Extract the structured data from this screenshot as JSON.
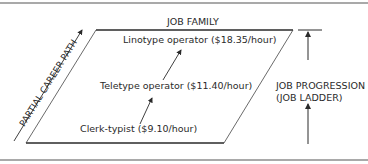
{
  "diagram": {
    "title": "JOB FAMILY",
    "jobs": [
      {
        "label": "Linotype operator ($18.35/hour)"
      },
      {
        "label": "Teletype operator ($11.40/hour)"
      },
      {
        "label": "Clerk-typist ($9.10/hour)"
      }
    ],
    "left_axis_label": "PARTIAL CAREER PATH",
    "right_axis_label_line1": "JOB PROGRESSION",
    "right_axis_label_line2": "(JOB LADDER)"
  }
}
